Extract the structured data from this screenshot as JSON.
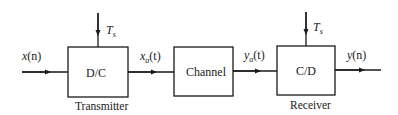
{
  "diagram": {
    "type": "block-diagram",
    "blocks": [
      {
        "id": "dc",
        "label": "D/C",
        "caption": "Transmitter",
        "clock": "T",
        "clock_sub": "s"
      },
      {
        "id": "channel",
        "label": "Channel"
      },
      {
        "id": "cd",
        "label": "C/D",
        "caption": "Receiver",
        "clock": "T",
        "clock_sub": "s"
      }
    ],
    "signals": {
      "input": {
        "base": "x",
        "arg": "(n)"
      },
      "xa": {
        "base": "x",
        "sub": "a",
        "arg": "(t)"
      },
      "ya": {
        "base": "y",
        "sub": "a",
        "arg": "(t)"
      },
      "output": {
        "base": "y",
        "arg": "(n)"
      }
    },
    "colors": {
      "stroke": "#1a1a1a",
      "background": "#ffffff"
    }
  }
}
